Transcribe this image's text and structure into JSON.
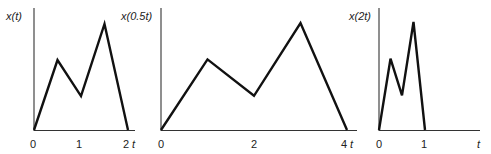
{
  "chart_data": [
    {
      "type": "line",
      "title": "",
      "ylabel": "x(t)",
      "xlabel": "t",
      "xticks": [
        "0",
        "1",
        "2"
      ],
      "xlim": [
        0,
        2
      ],
      "x": [
        0,
        0.5,
        1.0,
        1.5,
        2.0
      ],
      "y": [
        0,
        0.66,
        0.32,
        1.0,
        0
      ],
      "grid": false,
      "px": {
        "origin_x": 34,
        "base_y": 130,
        "unit_x": 47,
        "top_y": 24,
        "axis_end_x": 135,
        "axis_top_y": 8
      }
    },
    {
      "type": "line",
      "title": "",
      "ylabel": "x(0.5t)",
      "xlabel": "t",
      "xticks": [
        "0",
        "2",
        "4"
      ],
      "xlim": [
        0,
        4
      ],
      "x": [
        0,
        1,
        2,
        3,
        4
      ],
      "y": [
        0,
        0.66,
        0.32,
        1.0,
        0
      ],
      "grid": false,
      "px": {
        "origin_x": 161,
        "base_y": 130,
        "unit_x": 46.5,
        "top_y": 23,
        "axis_end_x": 357,
        "axis_top_y": 8
      }
    },
    {
      "type": "line",
      "title": "",
      "ylabel": "x(2t)",
      "xlabel": "t",
      "xticks": [
        "0",
        "1"
      ],
      "xlim": [
        0,
        1
      ],
      "x": [
        0,
        0.25,
        0.5,
        0.75,
        1.0
      ],
      "y": [
        0,
        0.66,
        0.32,
        1.0,
        0
      ],
      "grid": false,
      "px": {
        "origin_x": 379,
        "base_y": 130,
        "unit_x": 46,
        "top_y": 22,
        "axis_end_x": 480,
        "axis_top_y": 8
      }
    }
  ],
  "labels": {
    "plot1": {
      "ylabel": "x(t)",
      "tick0": "0",
      "tick1": "1",
      "tick2": "2",
      "t": "t"
    },
    "plot2": {
      "ylabel": "x(0.5t)",
      "tick0": "0",
      "tick1": "2",
      "tick2": "4",
      "t": "t"
    },
    "plot3": {
      "ylabel": "x(2t)",
      "tick0": "0",
      "tick1": "1",
      "t": "t"
    }
  }
}
